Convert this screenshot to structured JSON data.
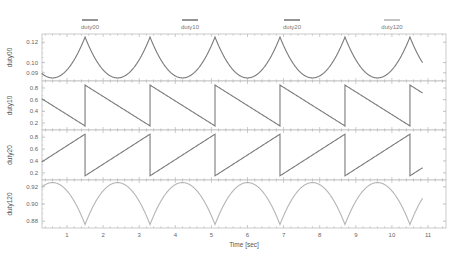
{
  "chart_data": {
    "type": "line",
    "layout": "4 vertically stacked subplots sharing x-axis",
    "xlabel": "Time [sec]",
    "x_ticks": [
      1,
      2,
      3,
      4,
      5,
      6,
      7,
      8,
      9,
      10,
      11
    ],
    "xlim": [
      0.3,
      11.5
    ],
    "grid": false,
    "legend_position": "top, horizontal",
    "legend": [
      {
        "name": "duty00",
        "color": "#7a7a7a"
      },
      {
        "name": "duty10",
        "color": "#7a7a7a"
      },
      {
        "name": "duty20",
        "color": "#7a7a7a"
      },
      {
        "name": "duty120",
        "color": "#b5b5b5"
      }
    ],
    "panels": [
      {
        "ylabel": "duty00",
        "y_ticks": [
          0.09,
          0.1,
          0.12
        ],
        "ylim": [
          0.082,
          0.128
        ],
        "shape": "cusp peaks (parabolic segments meeting at peaks)",
        "peak_times": [
          1.5,
          3.3,
          5.1,
          6.9,
          8.7,
          10.5
        ],
        "min_value": 0.085,
        "max_value": 0.125,
        "x_end": 10.85,
        "color": "#7a7a7a"
      },
      {
        "ylabel": "duty10",
        "y_ticks": [
          0.2,
          0.4,
          0.6,
          0.8
        ],
        "ylim": [
          0.08,
          0.92
        ],
        "shape": "falling sawtooth",
        "reset_times": [
          1.5,
          3.3,
          5.1,
          6.9,
          8.7,
          10.5
        ],
        "start_value": 0.58,
        "min_value": 0.15,
        "max_value": 0.85,
        "x_end": 10.85,
        "color": "#7a7a7a"
      },
      {
        "ylabel": "duty20",
        "y_ticks": [
          0.2,
          0.4,
          0.6,
          0.8
        ],
        "ylim": [
          0.08,
          0.92
        ],
        "shape": "rising sawtooth",
        "reset_times": [
          1.5,
          3.3,
          5.1,
          6.9,
          8.7,
          10.5
        ],
        "start_value": 0.43,
        "min_value": 0.15,
        "max_value": 0.85,
        "x_end": 10.85,
        "color": "#7a7a7a"
      },
      {
        "ylabel": "duty120",
        "y_ticks": [
          0.88,
          0.9,
          0.92
        ],
        "ylim": [
          0.872,
          0.928
        ],
        "shape": "inverted parabolic arcs (troughs at resets)",
        "trough_times": [
          1.5,
          3.3,
          5.1,
          6.9,
          8.7,
          10.5
        ],
        "min_value": 0.876,
        "max_value": 0.925,
        "x_end": 10.85,
        "color": "#b5b5b5"
      }
    ]
  }
}
